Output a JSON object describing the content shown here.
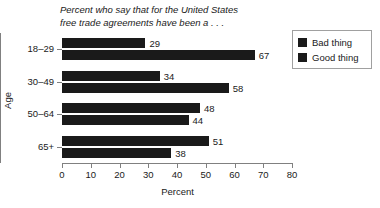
{
  "chart_data": {
    "type": "bar",
    "orientation": "horizontal",
    "title": "Percent who say that for the United States\nfree trade agreements have been a . . .",
    "xlabel": "Percent",
    "ylabel": "Age",
    "xlim": [
      0,
      80
    ],
    "xticks": [
      0,
      10,
      20,
      30,
      40,
      50,
      60,
      70,
      80
    ],
    "xtick_labels": [
      "0",
      "10",
      "20",
      "30",
      "40",
      "50",
      "60",
      "70",
      "80"
    ],
    "categories": [
      "18–29",
      "30–49",
      "50–64",
      "65+"
    ],
    "grid": false,
    "legend_position": "upper right",
    "series": [
      {
        "name": "Bad thing",
        "color": "#1a1a1a",
        "values": [
          29,
          34,
          48,
          51
        ]
      },
      {
        "name": "Good thing",
        "color": "#1a1a1a",
        "values": [
          67,
          58,
          44,
          38
        ]
      }
    ]
  },
  "legend": {
    "items": [
      {
        "label": "Bad thing",
        "color": "#1a1a1a"
      },
      {
        "label": "Good thing",
        "color": "#1a1a1a"
      }
    ]
  },
  "axes": {
    "x_title": "Percent",
    "y_title": "Age"
  },
  "colors": {
    "bar": "#1a1a1a",
    "axis": "#808080",
    "text": "#1a1a1a",
    "background": "#ffffff",
    "legend_border": "#a0a0a0"
  }
}
